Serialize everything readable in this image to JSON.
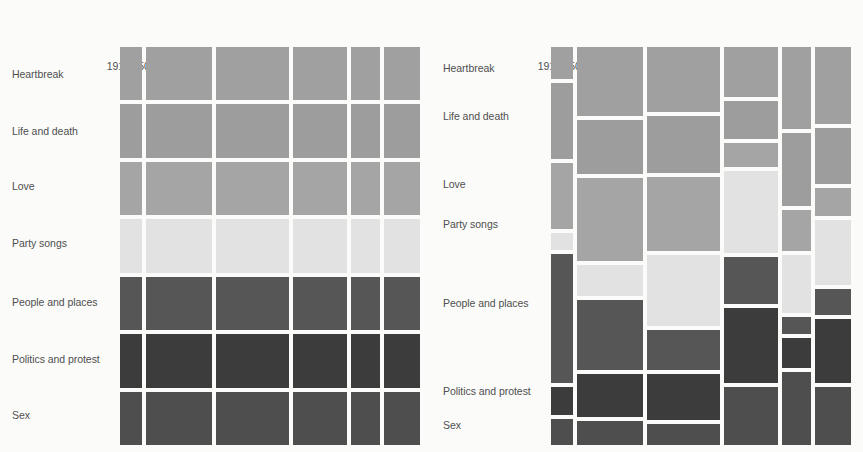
{
  "figure": {
    "background": "#fbfbfa",
    "text_color": "#4f4f4f"
  },
  "columns": [
    "1910s-50s",
    "1960s",
    "1970s",
    "1980s",
    "1990s",
    "2000s"
  ],
  "rows": [
    "Heartbreak",
    "Life and death",
    "Love",
    "Party songs",
    "People and places",
    "Politics and protest",
    "Sex"
  ],
  "theme_colors": {
    "Heartbreak": "#a0a0a0",
    "Life and death": "#9d9d9d",
    "Love": "#a5a5a5",
    "Party songs": "#e2e2e2",
    "People and places": "#565656",
    "Politics and protest": "#3c3c3c",
    "Sex": "#4e4e4e"
  },
  "chart_data": [
    {
      "type": "heatmap",
      "name": "left-uniform-row-chart",
      "title": "",
      "xlabel": "",
      "ylabel": "",
      "categories": [
        "1910s-50s",
        "1960s",
        "1970s",
        "1980s",
        "1990s",
        "2000s"
      ],
      "rows": [
        "Heartbreak",
        "Life and death",
        "Love",
        "Party songs",
        "People and places",
        "Politics and protest",
        "Sex"
      ],
      "column_widths": [
        7.0,
        21.5,
        23.5,
        17.5,
        9.5,
        11.5
      ],
      "row_heights": [
        14.3,
        14.3,
        14.3,
        14.3,
        14.3,
        14.3,
        14.3
      ],
      "notes": "Left panel: all rows share equal height; column widths encode decade share of songs.",
      "series": [
        {
          "name": "Heartbreak",
          "values": [
            7.0,
            21.5,
            23.5,
            17.5,
            9.5,
            11.5
          ]
        },
        {
          "name": "Life and death",
          "values": [
            7.0,
            21.5,
            23.5,
            17.5,
            9.5,
            11.5
          ]
        },
        {
          "name": "Love",
          "values": [
            7.0,
            21.5,
            23.5,
            17.5,
            9.5,
            11.5
          ]
        },
        {
          "name": "Party songs",
          "values": [
            7.0,
            21.5,
            23.5,
            17.5,
            9.5,
            11.5
          ]
        },
        {
          "name": "People and places",
          "values": [
            7.0,
            21.5,
            23.5,
            17.5,
            9.5,
            11.5
          ]
        },
        {
          "name": "Politics and protest",
          "values": [
            7.0,
            21.5,
            23.5,
            17.5,
            9.5,
            11.5
          ]
        },
        {
          "name": "Sex",
          "values": [
            7.0,
            21.5,
            23.5,
            17.5,
            9.5,
            11.5
          ]
        }
      ]
    },
    {
      "type": "heatmap",
      "name": "right-mosaic-chart",
      "title": "",
      "xlabel": "",
      "ylabel": "",
      "categories": [
        "1910s-50s",
        "1960s",
        "1970s",
        "1980s",
        "1990s",
        "2000s"
      ],
      "rows": [
        "Heartbreak",
        "Life and death",
        "Love",
        "Party songs",
        "People and places",
        "Politics and protest",
        "Sex"
      ],
      "column_widths": [
        7.0,
        21.5,
        23.5,
        17.5,
        9.5,
        11.5
      ],
      "notes": "Right panel: marimekko/mosaic — column widths encode decade share, row heights within each column encode that theme's share of that decade.",
      "series": [
        {
          "name": "Heartbreak",
          "values": [
            8.5,
            18.5,
            17.5,
            13.5,
            22.0,
            20.5
          ]
        },
        {
          "name": "Life and death",
          "values": [
            20.5,
            14.5,
            15.0,
            10.0,
            19.5,
            15.0
          ]
        },
        {
          "name": "Love",
          "values": [
            17.5,
            22.0,
            20.0,
            6.5,
            11.0,
            7.5
          ]
        },
        {
          "name": "Party songs",
          "values": [
            4.5,
            8.5,
            19.0,
            22.0,
            15.5,
            17.5
          ]
        },
        {
          "name": "People and places",
          "values": [
            34.5,
            18.5,
            10.5,
            12.5,
            4.5,
            7.0
          ]
        },
        {
          "name": "Politics and protest",
          "values": [
            7.5,
            11.5,
            12.5,
            20.0,
            8.0,
            17.0
          ]
        },
        {
          "name": "Sex",
          "values": [
            7.0,
            6.5,
            5.5,
            15.5,
            19.5,
            15.5
          ]
        }
      ]
    }
  ],
  "left_panel": {
    "plot": {
      "x": 120,
      "y": 47,
      "width": 300,
      "height": 398
    },
    "col_header_y": 30,
    "label_x": 12,
    "label_y": [
      68,
      125,
      180,
      237,
      296,
      353,
      409
    ]
  },
  "right_panel": {
    "plot": {
      "x": 120,
      "y": 47,
      "width": 300,
      "height": 398
    },
    "col_header_y": 30,
    "label_x": 12,
    "label_y": [
      62,
      110,
      178,
      218,
      297,
      385,
      419
    ]
  }
}
